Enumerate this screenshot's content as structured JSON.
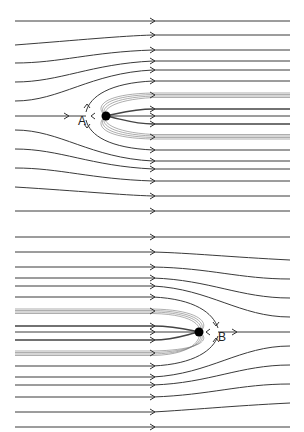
{
  "figure": {
    "panels": [
      {
        "id": "top",
        "description": "Uniform flow plus point source A: streamlines deflect around a Rankine half-body (Rankine nose) opening to the right",
        "point": {
          "label": "A",
          "x": 106,
          "y": 116
        },
        "label_pos": {
          "x": 78,
          "y": 125
        }
      },
      {
        "id": "bottom",
        "description": "Uniform flow plus point sink B: streamlines converge into closed half-body opening to the left",
        "point": {
          "label": "B",
          "x": 199,
          "y": 332
        },
        "label_pos": {
          "x": 218,
          "y": 341
        }
      }
    ],
    "colors": {
      "line": "#3a3a3a",
      "thin": "#777777",
      "dot": "#000000",
      "background": "#ffffff"
    }
  }
}
